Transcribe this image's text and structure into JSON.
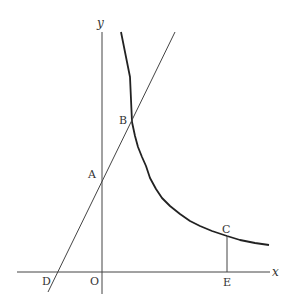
{
  "diagram": {
    "type": "coordinate-graph",
    "axes": {
      "x_label": "x",
      "y_label": "y",
      "origin_label": "O"
    },
    "curve": {
      "description": "hyperbola y = k/x (first quadrant)"
    },
    "line": {
      "description": "straight line through D, A, B"
    },
    "points": {
      "A": "A",
      "B": "B",
      "C": "C",
      "D": "D",
      "E": "E"
    },
    "segments": [
      "CE (vertical from C to x-axis)"
    ],
    "colors": {
      "stroke": "#333333",
      "background": "#ffffff"
    }
  }
}
